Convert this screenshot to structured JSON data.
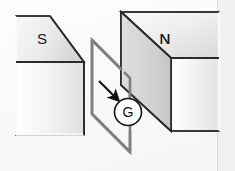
{
  "figure": {
    "background_color": "#fbfbfb",
    "border_color": "#d6d6d6"
  },
  "magnets": {
    "left": {
      "pole_label": "S",
      "name": "south-pole-magnet",
      "front_face_fill_start": "#ffffff",
      "front_face_fill_end": "#e2e2e2",
      "top_face_fill_start": "#f6f6f6",
      "top_face_fill_end": "#d8d8d8",
      "edge_color": "#2b2b2b"
    },
    "right": {
      "pole_label": "N",
      "name": "north-pole-magnet",
      "front_face_fill_start": "#dcdcdc",
      "front_face_fill_end": "#c9c9c9",
      "top_face_fill_start": "#f8f8f8",
      "top_face_fill_end": "#dedede",
      "side_face_fill_start": "#ffffff",
      "side_face_fill_end": "#e4e4e4",
      "edge_color": "#2b2b2b"
    }
  },
  "loop": {
    "name": "wire-loop",
    "stroke_color": "#808080",
    "stroke_width": "2.6"
  },
  "galvanometer": {
    "label": "G",
    "fill": "#ffffff",
    "stroke": "#111111"
  },
  "motion_arrow": {
    "name": "motion-direction-arrow",
    "color": "#111111",
    "direction": "down-right"
  }
}
